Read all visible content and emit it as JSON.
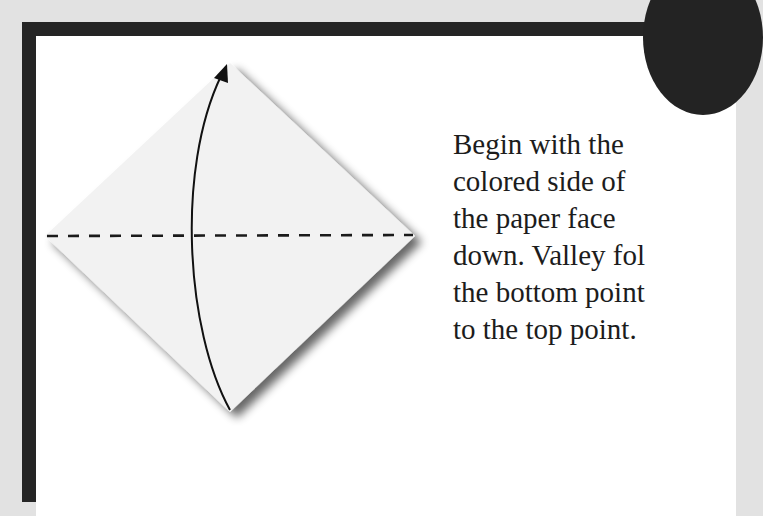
{
  "step": {
    "badge_color": "#232323",
    "border_color": "#252525",
    "background_color": "#e2e2e2",
    "instruction_lines": [
      "Begin with the",
      "colored side of",
      "the paper face",
      "down. Valley fol",
      "the bottom point",
      "to the top point."
    ]
  },
  "diagram": {
    "shape": "square-paper-as-diamond",
    "fold_line": "valley-fold-dashed-horizontal",
    "arrow": "curved-arrow-bottom-to-top",
    "paper_color": "#f2f2f2"
  }
}
